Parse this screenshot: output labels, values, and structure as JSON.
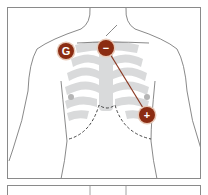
{
  "diagram": {
    "electrodes": [
      {
        "id": "ground",
        "label": "G",
        "x": 66,
        "y": 51
      },
      {
        "id": "negative",
        "label": "−",
        "x": 106,
        "y": 48
      },
      {
        "id": "positive",
        "label": "+",
        "x": 147,
        "y": 115
      }
    ],
    "colors": {
      "electrode": "#8b2c12",
      "lead_wire": "#8b3a24",
      "outline": "#6b6b6b",
      "ribcage": "#d9dadb",
      "nipple": "#b5b5b5",
      "dashed": "#333333"
    }
  }
}
